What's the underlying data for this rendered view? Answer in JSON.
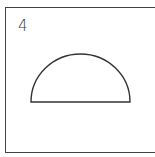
{
  "figure": {
    "label": "4",
    "shape": "semicircle",
    "stroke_color": "#333333",
    "border_color": "#444444"
  }
}
